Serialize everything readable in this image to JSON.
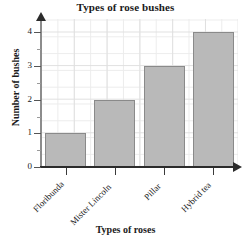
{
  "chart_data": {
    "type": "bar",
    "title": "Types of rose bushes",
    "xlabel": "Types of roses",
    "ylabel": "Number of bushes",
    "categories": [
      "Floribunda",
      "Mister Lincoln",
      "Pillar",
      "Hybrid tea"
    ],
    "values": [
      1,
      2,
      3,
      4
    ],
    "ylim": [
      0,
      4.4
    ],
    "yticks": [
      0,
      1,
      2,
      3,
      4
    ],
    "ytick_labels": [
      "0",
      "1",
      "2",
      "3",
      "4"
    ],
    "grid": true,
    "legend": "none",
    "bar_color": "#b9b9b9",
    "bar_edge_color": "#8a8a8a",
    "grid_color": "#e4e4e4",
    "axis_color": "#2b2b2b",
    "text_color": "#1a1a1a"
  }
}
